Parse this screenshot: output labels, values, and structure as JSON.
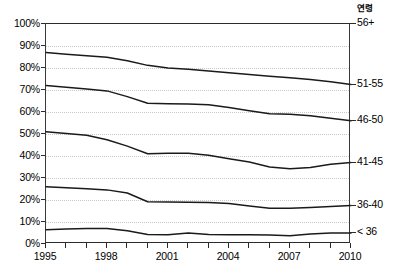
{
  "legend_title": "연령",
  "y_axis": {
    "ticks": [
      "100%",
      "90%",
      "80%",
      "70%",
      "60%",
      "50%",
      "40%",
      "30%",
      "20%",
      "10%",
      "0%"
    ],
    "values": [
      100,
      90,
      80,
      70,
      60,
      50,
      40,
      30,
      20,
      10,
      0
    ]
  },
  "x_axis": {
    "labels": [
      "1995",
      "1998",
      "2001",
      "2004",
      "2007",
      "2010"
    ],
    "label_years": [
      1995,
      1998,
      2001,
      2004,
      2007,
      2010
    ],
    "tick_years": [
      1995,
      1996,
      1997,
      1998,
      1999,
      2000,
      2001,
      2002,
      2003,
      2004,
      2005,
      2006,
      2007,
      2008,
      2009,
      2010
    ]
  },
  "band_labels": [
    {
      "label": "56+",
      "value": 100
    },
    {
      "label": "51-55",
      "value": 72.5
    },
    {
      "label": "46-50",
      "value": 56.0
    },
    {
      "label": "41-45",
      "value": 37.0
    },
    {
      "label": "36-40",
      "value": 17.5
    },
    {
      "label": "< 36",
      "value": 5.0
    }
  ],
  "colors": {
    "line": "#1a1a1a",
    "axis": "#2b2b2b",
    "grid": "#c9c9c9",
    "background": "#ffffff"
  },
  "chart_data": {
    "type": "line",
    "title": "",
    "subtitle": "",
    "xlabel": "",
    "ylabel": "",
    "xlim": [
      1995,
      2010
    ],
    "ylim": [
      0,
      100
    ],
    "grid": true,
    "legend_position": "right",
    "legend_title": "연령",
    "annotations": [
      "연령",
      "56+",
      "51-55",
      "46-50",
      "41-45",
      "36-40",
      "< 36"
    ],
    "x": [
      1995,
      1996,
      1997,
      1998,
      1999,
      2000,
      2001,
      2002,
      2003,
      2004,
      2005,
      2006,
      2007,
      2008,
      2009,
      2010
    ],
    "series": [
      {
        "name": "56+ lower boundary (cumulative through 51-55)",
        "label": "51-55",
        "values": [
          87.0,
          86.3,
          85.6,
          84.9,
          83.3,
          81.2,
          80.0,
          79.4,
          78.6,
          77.8,
          77.0,
          76.3,
          75.6,
          74.8,
          73.8,
          72.5
        ]
      },
      {
        "name": "51-55 lower boundary (cumulative through 46-50)",
        "label": "46-50",
        "values": [
          72.0,
          71.2,
          70.4,
          69.6,
          67.0,
          64.0,
          63.8,
          63.6,
          63.3,
          62.0,
          60.6,
          59.2,
          59.0,
          58.3,
          57.2,
          56.0
        ]
      },
      {
        "name": "46-50 lower boundary (cumulative through 41-45)",
        "label": "41-45",
        "values": [
          51.0,
          50.2,
          49.4,
          47.4,
          44.5,
          41.0,
          41.3,
          41.2,
          40.3,
          38.8,
          37.3,
          35.0,
          34.2,
          34.8,
          36.2,
          37.0
        ]
      },
      {
        "name": "41-45 lower boundary (cumulative through 36-40)",
        "label": "36-40",
        "values": [
          26.0,
          25.6,
          25.1,
          24.6,
          23.2,
          19.2,
          19.1,
          19.0,
          18.9,
          18.4,
          17.3,
          16.3,
          16.2,
          16.6,
          17.1,
          17.5
        ]
      },
      {
        "name": "36-40 lower boundary (cumulative through < 36)",
        "label": "< 36",
        "values": [
          6.5,
          6.8,
          7.0,
          7.0,
          6.0,
          4.3,
          4.2,
          5.0,
          4.3,
          4.2,
          4.2,
          4.1,
          3.8,
          4.6,
          5.0,
          5.0
        ]
      }
    ]
  }
}
